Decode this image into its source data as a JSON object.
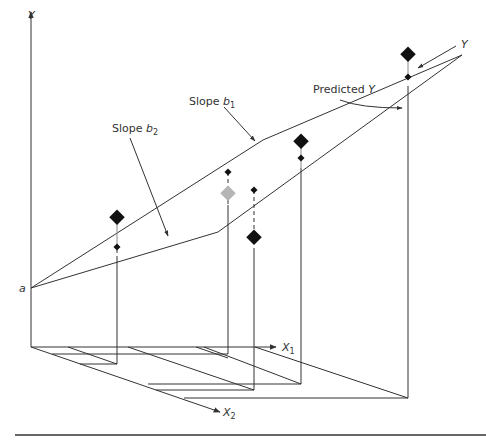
{
  "diagram": {
    "type": "3d regression plane",
    "labels": {
      "y_axis": "Y",
      "intercept": "a",
      "x1_axis": "X",
      "x1_sub": "1",
      "x2_axis": "X",
      "x2_sub": "2",
      "slope_b1_prefix": "Slope ",
      "slope_b1_var": "b",
      "slope_b1_sub": "1",
      "slope_b2_prefix": "Slope ",
      "slope_b2_var": "b",
      "slope_b2_sub": "2",
      "predicted_prefix": "Predicted ",
      "predicted_var": "Y",
      "observed_y": "Y"
    },
    "colors": {
      "line": "#333333",
      "point_observed": "#111111",
      "point_highlight": "#b5b5b5",
      "text": "#333333"
    },
    "points": [
      {
        "name": "point-1",
        "observed": [
          117,
          218
        ],
        "predicted": [
          117,
          247
        ],
        "observed_size": "large"
      },
      {
        "name": "point-2",
        "observed": [
          228,
          194
        ],
        "predicted": [
          228,
          172
        ],
        "observed_size": "large",
        "highlight": true
      },
      {
        "name": "point-3",
        "observed": [
          254,
          238
        ],
        "predicted": [
          254,
          190
        ],
        "observed_size": "large"
      },
      {
        "name": "point-4",
        "observed": [
          301,
          142
        ],
        "predicted": [
          301,
          158
        ],
        "observed_size": "large"
      },
      {
        "name": "point-5",
        "observed": [
          408,
          55
        ],
        "predicted": [
          408,
          77
        ],
        "observed_size": "large"
      }
    ]
  }
}
